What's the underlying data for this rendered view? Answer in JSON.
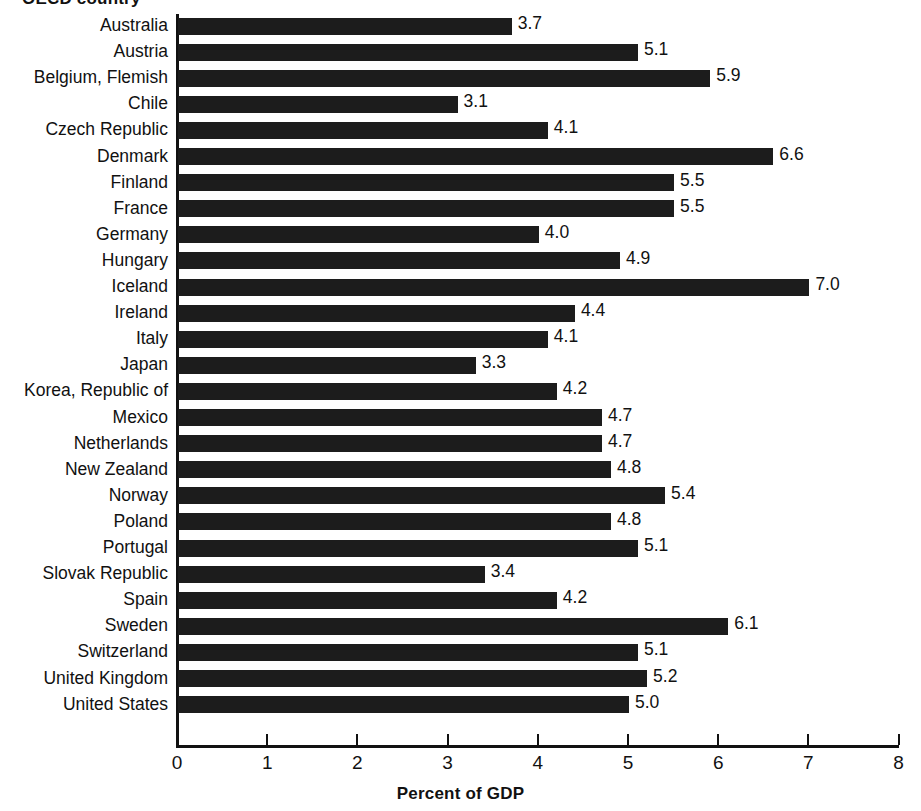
{
  "chart_data": {
    "type": "bar",
    "orientation": "horizontal",
    "title": "OECD country",
    "xlabel": "Percent of GDP",
    "ylabel": "OECD country",
    "xlim": [
      0,
      8
    ],
    "xticks": [
      "0",
      "1",
      "2",
      "3",
      "4",
      "5",
      "6",
      "7",
      "8"
    ],
    "grid": false,
    "legend": false,
    "bar_color": "#1c1c1c",
    "categories": [
      "Australia",
      "Austria",
      "Belgium, Flemish",
      "Chile",
      "Czech Republic",
      "Denmark",
      "Finland",
      "France",
      "Germany",
      "Hungary",
      "Iceland",
      "Ireland",
      "Italy",
      "Japan",
      "Korea, Republic of",
      "Mexico",
      "Netherlands",
      "New Zealand",
      "Norway",
      "Poland",
      "Portugal",
      "Slovak Republic",
      "Spain",
      "Sweden",
      "Switzerland",
      "United Kingdom",
      "United States"
    ],
    "values": [
      3.7,
      5.1,
      5.9,
      3.1,
      4.1,
      6.6,
      5.5,
      5.5,
      4.0,
      4.9,
      7.0,
      4.4,
      4.1,
      3.3,
      4.2,
      4.7,
      4.7,
      4.8,
      5.4,
      4.8,
      5.1,
      3.4,
      4.2,
      6.1,
      5.1,
      5.2,
      5.0
    ],
    "value_labels": [
      "3.7",
      "5.1",
      "5.9",
      "3.1",
      "4.1",
      "6.6",
      "5.5",
      "5.5",
      "4.0",
      "4.9",
      "7.0",
      "4.4",
      "4.1",
      "3.3",
      "4.2",
      "4.7",
      "4.7",
      "4.8",
      "5.4",
      "4.8",
      "5.1",
      "3.4",
      "4.2",
      "6.1",
      "5.1",
      "5.2",
      "5.0"
    ]
  }
}
